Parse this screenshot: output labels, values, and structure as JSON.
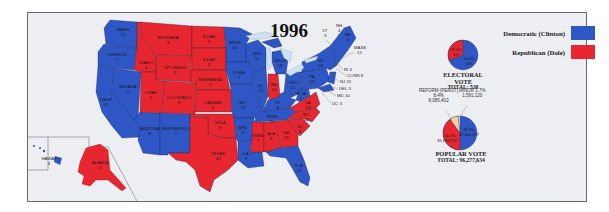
{
  "title": "1996",
  "colors": {
    "democratic": "#2e56c4",
    "republican": "#e8262f",
    "reform": "#f4d29a",
    "minor": "#f3f0e0",
    "water": "#cfe1f2",
    "background": "#eceef1"
  },
  "legend": [
    {
      "label": "Democratic (Clinton)",
      "color": "#2e56c4"
    },
    {
      "label": "Republican (Dole)",
      "color": "#e8262f"
    }
  ],
  "electoral_vote": {
    "caption": "ELECTORAL VOTE",
    "total_label": "TOTAL: 538",
    "slices": [
      {
        "party": "Democratic (Clinton)",
        "pct": "70.4%",
        "votes": "379"
      },
      {
        "party": "Republican (Dole)",
        "pct": "29.6%",
        "votes": "159"
      }
    ]
  },
  "popular_vote": {
    "caption": "POPULAR VOTE",
    "total_label": "TOTAL: 96,277,634",
    "slices": [
      {
        "party": "Democratic (Clinton)",
        "pct": "49.2%",
        "votes": "47,402,357"
      },
      {
        "party": "Republican (Dole)",
        "pct": "40.7%",
        "votes": "39,198,755"
      },
      {
        "party": "Reform (Perot)",
        "label": "REFORM (PEROT)",
        "pct": "8.4%",
        "votes": "8,085,402"
      },
      {
        "party": "Minor",
        "label": "MINOR 1.7%",
        "pct": "1.7%",
        "votes": "1,591,120"
      }
    ]
  },
  "states": [
    {
      "abbr": "WASH",
      "ev": "11",
      "winner": "D"
    },
    {
      "abbr": "OREGON",
      "ev": "7",
      "winner": "D"
    },
    {
      "abbr": "CALIF",
      "ev": "54",
      "winner": "D"
    },
    {
      "abbr": "NEVADA",
      "ev": "4",
      "winner": "D"
    },
    {
      "abbr": "IDAHO",
      "ev": "4",
      "winner": "R"
    },
    {
      "abbr": "MONTANA",
      "ev": "3",
      "winner": "R"
    },
    {
      "abbr": "WYOMING",
      "ev": "3",
      "winner": "R"
    },
    {
      "abbr": "UTAH",
      "ev": "5",
      "winner": "R"
    },
    {
      "abbr": "COLORADO",
      "ev": "8",
      "winner": "R"
    },
    {
      "abbr": "ARIZONA",
      "ev": "8",
      "winner": "D"
    },
    {
      "abbr": "NEW MEXICO",
      "ev": "5",
      "winner": "D"
    },
    {
      "abbr": "N.DAK",
      "ev": "3",
      "winner": "R"
    },
    {
      "abbr": "S.DAK",
      "ev": "3",
      "winner": "R"
    },
    {
      "abbr": "NEBRASKA",
      "ev": "5",
      "winner": "R"
    },
    {
      "abbr": "KANSAS",
      "ev": "6",
      "winner": "R"
    },
    {
      "abbr": "OKLA",
      "ev": "8",
      "winner": "R"
    },
    {
      "abbr": "TEXAS",
      "ev": "32",
      "winner": "R"
    },
    {
      "abbr": "MINN",
      "ev": "10",
      "winner": "D"
    },
    {
      "abbr": "IOWA",
      "ev": "7",
      "winner": "D"
    },
    {
      "abbr": "MO",
      "ev": "11",
      "winner": "D"
    },
    {
      "abbr": "ARK",
      "ev": "6",
      "winner": "D"
    },
    {
      "abbr": "LA",
      "ev": "9",
      "winner": "D"
    },
    {
      "abbr": "WIS",
      "ev": "11",
      "winner": "D"
    },
    {
      "abbr": "ILL",
      "ev": "22",
      "winner": "D"
    },
    {
      "abbr": "MICH",
      "ev": "18",
      "winner": "D"
    },
    {
      "abbr": "IND",
      "ev": "12",
      "winner": "R"
    },
    {
      "abbr": "OHIO",
      "ev": "21",
      "winner": "D"
    },
    {
      "abbr": "KY",
      "ev": "8",
      "winner": "D"
    },
    {
      "abbr": "TENN",
      "ev": "11",
      "winner": "D"
    },
    {
      "abbr": "MISS",
      "ev": "7",
      "winner": "R"
    },
    {
      "abbr": "ALA",
      "ev": "9",
      "winner": "R"
    },
    {
      "abbr": "GA",
      "ev": "13",
      "winner": "R"
    },
    {
      "abbr": "FLA",
      "ev": "25",
      "winner": "D"
    },
    {
      "abbr": "SC",
      "ev": "8",
      "winner": "R"
    },
    {
      "abbr": "NC",
      "ev": "14",
      "winner": "R"
    },
    {
      "abbr": "VA",
      "ev": "13",
      "winner": "R"
    },
    {
      "abbr": "W.VA",
      "ev": "5",
      "winner": "D"
    },
    {
      "abbr": "PA",
      "ev": "23",
      "winner": "D"
    },
    {
      "abbr": "NY",
      "ev": "33",
      "winner": "D"
    },
    {
      "abbr": "VT",
      "ev": "3",
      "winner": "D"
    },
    {
      "abbr": "NH",
      "ev": "4",
      "winner": "D"
    },
    {
      "abbr": "ME",
      "ev": "4",
      "winner": "D"
    },
    {
      "abbr": "MASS",
      "ev": "12",
      "winner": "D"
    },
    {
      "abbr": "RI",
      "ev": "4",
      "winner": "D"
    },
    {
      "abbr": "CONN",
      "ev": "8",
      "winner": "D"
    },
    {
      "abbr": "NJ",
      "ev": "15",
      "winner": "D"
    },
    {
      "abbr": "DEL",
      "ev": "3",
      "winner": "D"
    },
    {
      "abbr": "MD",
      "ev": "10",
      "winner": "D"
    },
    {
      "abbr": "DC",
      "ev": "3",
      "winner": "D"
    },
    {
      "abbr": "HAWAII",
      "ev": "4",
      "winner": "D"
    },
    {
      "abbr": "ALASKA",
      "ev": "3",
      "winner": "R"
    }
  ],
  "labels": {
    "WASH": "WASH",
    "WASH_ev": "11",
    "OREGON": "OREGON",
    "OREGON_ev": "7",
    "CALIF": "CALIF",
    "CALIF_ev": "54",
    "NEVADA": "NEVADA",
    "NEVADA_ev": "4",
    "IDAHO": "IDAHO",
    "IDAHO_ev": "4",
    "MONTANA": "MONTANA",
    "MONTANA_ev": "3",
    "WYOMING": "WYOMING",
    "WYOMING_ev": "3",
    "UTAH": "UTAH",
    "UTAH_ev": "5",
    "COLORADO": "COLORADO",
    "COLORADO_ev": "8",
    "ARIZONA": "ARIZONA",
    "ARIZONA_ev": "8",
    "NEWMEXICO": "NEW MEXICO",
    "NEWMEXICO_ev": "5",
    "NDAK": "N.DAK",
    "NDAK_ev": "3",
    "SDAK": "S.DAK",
    "SDAK_ev": "3",
    "NEBRASKA": "NEBRASKA",
    "NEBRASKA_ev": "5",
    "KANSAS": "KANSAS",
    "KANSAS_ev": "6",
    "OKLA": "OKLA",
    "OKLA_ev": "8",
    "TEXAS": "TEXAS",
    "TEXAS_ev": "32",
    "MINN": "MINN",
    "MINN_ev": "10",
    "IOWA": "IOWA",
    "IOWA_ev": "7",
    "MO": "MO",
    "MO_ev": "11",
    "ARK": "ARK",
    "ARK_ev": "6",
    "LA": "LA",
    "LA_ev": "9",
    "WIS": "WIS",
    "WIS_ev": "11",
    "ILL": "ILL",
    "ILL_ev": "22",
    "MICH": "MICH",
    "MICH_ev": "18",
    "IND": "IND",
    "IND_ev": "12",
    "OHIO": "OHIO",
    "OHIO_ev": "21",
    "KY": "KY",
    "KY_ev": "8",
    "TENN": "TENN",
    "TENN_ev": "11",
    "MISS": "MISS",
    "MISS_ev": "7",
    "ALA": "ALA",
    "ALA_ev": "9",
    "GA": "GA",
    "GA_ev": "13",
    "FLA": "FLA",
    "FLA_ev": "25",
    "SC": "SC",
    "SC_ev": "8",
    "NC": "NC",
    "NC_ev": "14",
    "VA": "VA",
    "VA_ev": "13",
    "WVA": "W.VA",
    "WVA_ev": "5",
    "PA": "PA",
    "PA_ev": "23",
    "NY": "NY",
    "NY_ev": "33",
    "VT": "VT",
    "VT_ev": "3",
    "NH": "NH",
    "NH_ev": "4",
    "ME": "ME",
    "ME_ev": "4",
    "MASS": "MASS",
    "MASS_ev": "12",
    "RI": "RI 4",
    "CONN": "CONN 8",
    "NJ": "NJ 15",
    "DEL": "DEL 3",
    "MD": "MD 10",
    "DC": "DC 3",
    "HAWAII": "HAWAII",
    "HAWAII_ev": "4",
    "ALASKA": "ALASKA",
    "ALASKA_ev": "3"
  }
}
